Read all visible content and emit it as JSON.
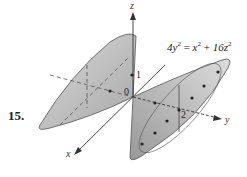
{
  "problem_number": "15.",
  "equation": {
    "lhs": "4y",
    "lhs_exp": "2",
    "eq": " = ",
    "t1": "x",
    "t1_exp": "2",
    "plus": " + ",
    "t2": "16z",
    "t2_exp": "2"
  },
  "axes": {
    "x": "x",
    "y": "y",
    "z": "z"
  },
  "ticks": {
    "origin": "0",
    "z1": "1",
    "y2": "2"
  },
  "colors": {
    "surface": "#c8c8c8",
    "edge": "#555555",
    "axis": "#333333"
  }
}
